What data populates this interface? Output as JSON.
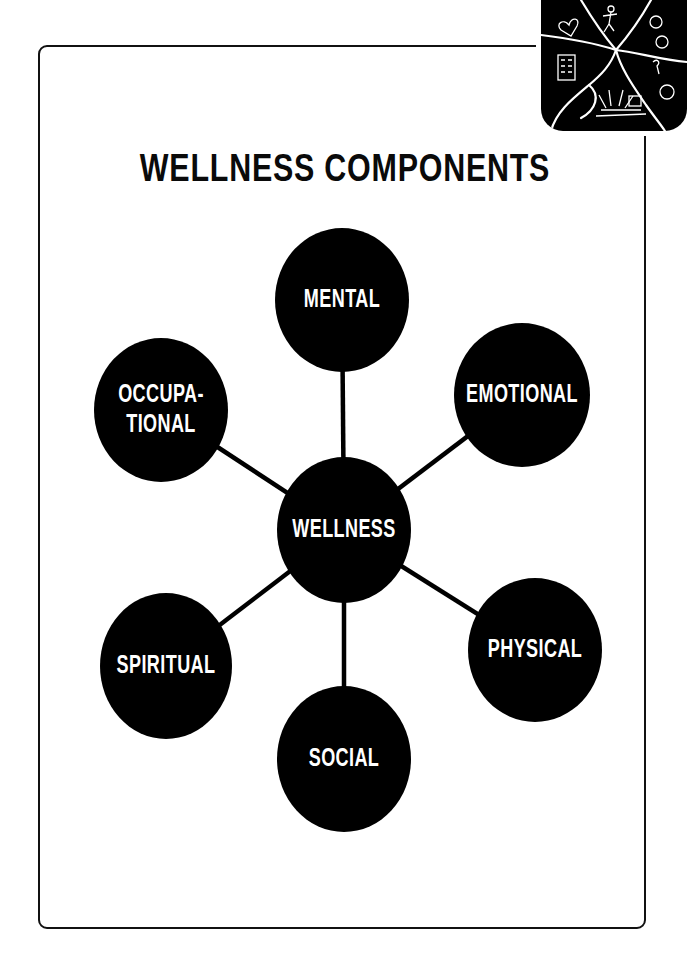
{
  "title": "WELLNESS COMPONENTS",
  "logo": {
    "icon": "wellness-collage-logo-icon",
    "description": "Black rounded square divided by white lines into segments with hand-drawn heart, dancing figure, faces, question mark, building and sunrise sketches"
  },
  "colors": {
    "node_fill": "#000000",
    "node_text": "#ffffff",
    "connector": "#000000",
    "frame": "#111111",
    "background": "#ffffff"
  },
  "center": {
    "label": "WELLNESS",
    "cx": 344,
    "cy": 530,
    "rx": 67,
    "ry": 73
  },
  "nodes": [
    {
      "id": "mental",
      "lines": [
        "MENTAL"
      ],
      "cx": 342,
      "cy": 300,
      "rx": 67,
      "ry": 72
    },
    {
      "id": "emotional",
      "lines": [
        "EMOTIONAL"
      ],
      "cx": 522,
      "cy": 395,
      "rx": 68,
      "ry": 72
    },
    {
      "id": "occupational",
      "lines": [
        "OCCUPA-",
        "TIONAL"
      ],
      "cx": 161,
      "cy": 410,
      "rx": 67,
      "ry": 72
    },
    {
      "id": "physical",
      "lines": [
        "PHYSICAL"
      ],
      "cx": 535,
      "cy": 650,
      "rx": 67,
      "ry": 72
    },
    {
      "id": "spiritual",
      "lines": [
        "SPIRITUAL"
      ],
      "cx": 166,
      "cy": 666,
      "rx": 66,
      "ry": 73
    },
    {
      "id": "social",
      "lines": [
        "SOCIAL"
      ],
      "cx": 344,
      "cy": 759,
      "rx": 67,
      "ry": 73
    }
  ]
}
